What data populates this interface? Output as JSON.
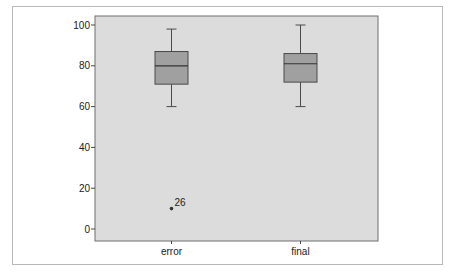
{
  "chart_data": {
    "type": "boxplot",
    "title": "",
    "xlabel": "",
    "ylabel": "",
    "categories": [
      "error",
      "final"
    ],
    "ylim": [
      -5,
      105
    ],
    "yticks": [
      0,
      20,
      40,
      60,
      80,
      100
    ],
    "grid": false,
    "legend": null,
    "series": [
      {
        "name": "error",
        "whisker_low": 60,
        "q1": 71,
        "median": 80,
        "q3": 87,
        "whisker_high": 98,
        "outliers": [
          {
            "value": 10,
            "label": "26"
          }
        ]
      },
      {
        "name": "final",
        "whisker_low": 60,
        "q1": 72,
        "median": 81,
        "q3": 86,
        "whisker_high": 100,
        "outliers": []
      }
    ],
    "colors": {
      "plot_background": "#dcdcdc",
      "box_fill": "#a0a0a0",
      "box_stroke": "#4a4a4a",
      "frame": "#b8b8b8"
    }
  },
  "labels": {
    "y_ticks": [
      "0",
      "20",
      "40",
      "60",
      "80",
      "100"
    ],
    "categories": [
      "error",
      "final"
    ],
    "outlier_label": "26"
  }
}
